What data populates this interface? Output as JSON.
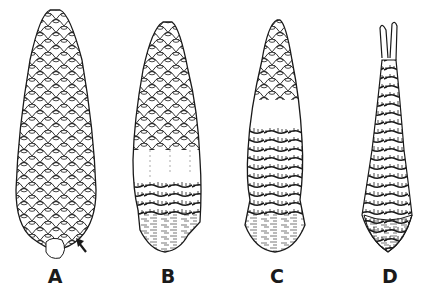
{
  "figure": {
    "panels": [
      {
        "label": "A",
        "description": "intact cone with arrow at base",
        "cx": 55
      },
      {
        "label": "B",
        "description": "cone partially stripped at base",
        "cx": 168
      },
      {
        "label": "C",
        "description": "cone stripped over lower two-thirds",
        "cx": 277
      },
      {
        "label": "D",
        "description": "fully stripped cone core",
        "cx": 390
      }
    ],
    "colors": {
      "ink": "#1a1a1a",
      "background": "#ffffff"
    }
  }
}
